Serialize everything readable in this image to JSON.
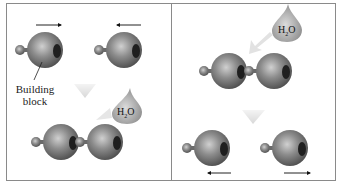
{
  "diagram": {
    "left_panel": {
      "name": "dehydration-synthesis",
      "label_building_block_line1": "Building",
      "label_building_block_line2": "block",
      "water": {
        "main": "H",
        "sub": "2",
        "end": "O"
      }
    },
    "right_panel": {
      "name": "hydrolysis",
      "water": {
        "main": "H",
        "sub": "2",
        "end": "O"
      }
    },
    "colors": {
      "sphere": "#7a7a7a",
      "sphere_highlight": "#c9c9c9",
      "water_drop": "#b0b0b0",
      "arrow_fill": "#ececec",
      "border": "#8a8a8a"
    }
  }
}
